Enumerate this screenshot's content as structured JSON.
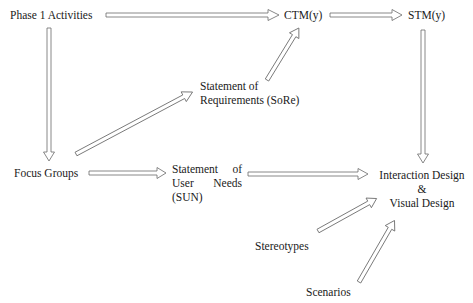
{
  "diagram": {
    "nodes": {
      "phase1": "Phase 1 Activities",
      "ctm": "CTM(y)",
      "stm": "STM(y)",
      "sore_line1": "Statement of",
      "sore_line2": "Requirements (SoRe)",
      "focus_groups": "Focus Groups",
      "sun_line1a": "Statement",
      "sun_line1b": "of",
      "sun_line2a": "User",
      "sun_line2b": "Needs",
      "sun_line3": "(SUN)",
      "design_line1": "Interaction Design",
      "design_line2": "&",
      "design_line3": "Visual Design",
      "stereotypes": "Stereotypes",
      "scenarios": "Scenarios"
    },
    "edges": [
      {
        "from": "Phase 1 Activities",
        "to": "CTM(y)"
      },
      {
        "from": "CTM(y)",
        "to": "STM(y)"
      },
      {
        "from": "STM(y)",
        "to": "Interaction Design & Visual Design"
      },
      {
        "from": "Phase 1 Activities",
        "to": "Focus Groups"
      },
      {
        "from": "Focus Groups",
        "to": "Statement of Requirements (SoRe)"
      },
      {
        "from": "Statement of Requirements (SoRe)",
        "to": "CTM(y)"
      },
      {
        "from": "Focus Groups",
        "to": "Statement of User Needs (SUN)"
      },
      {
        "from": "Statement of User Needs (SUN)",
        "to": "Interaction Design & Visual Design"
      },
      {
        "from": "Stereotypes",
        "to": "Interaction Design & Visual Design"
      },
      {
        "from": "Scenarios",
        "to": "Interaction Design & Visual Design"
      }
    ],
    "colors": {
      "text": "#1a1a1a",
      "arrow_stroke": "#6a6a6a",
      "background": "#ffffff"
    }
  }
}
